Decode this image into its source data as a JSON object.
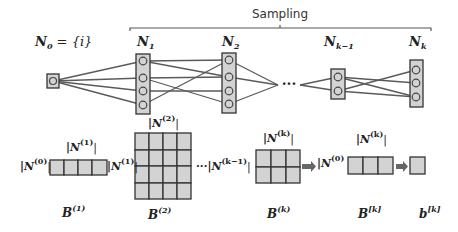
{
  "diagram": {
    "title": "Sampling",
    "colors": {
      "box_fill": "#d3d3d3",
      "box_stroke": "#333333",
      "edge": "#5a5a5a",
      "arrow": "#666666",
      "background": "#ffffff"
    },
    "layers": [
      {
        "id": "N0",
        "label_main": "N",
        "label_sub": "0",
        "label_rest": " = {i}",
        "nodes": 1
      },
      {
        "id": "N1",
        "label_main": "N",
        "label_sub": "1",
        "nodes": 4
      },
      {
        "id": "N2",
        "label_main": "N",
        "label_sub": "2",
        "nodes": 4
      },
      {
        "id": "Nk-1",
        "label_main": "N",
        "label_sub": "k−1",
        "nodes": 2
      },
      {
        "id": "Nk",
        "label_main": "N",
        "label_sub": "k",
        "nodes": 3
      }
    ],
    "ellipsis": "···",
    "matrices": [
      {
        "id": "B1",
        "rows": 1,
        "cols": 4,
        "row_label_main": "|N",
        "row_label_sup": "(0)",
        "col_label_main": "|N",
        "col_label_sup": "(1)",
        "name_main": "B",
        "name_sup": "(1)"
      },
      {
        "id": "B2",
        "rows": 4,
        "cols": 4,
        "row_label_main": "|N",
        "row_label_sup": "(1)",
        "col_label_main": "|N",
        "col_label_sup": "(2)",
        "name_main": "B",
        "name_sup": "(2)"
      },
      {
        "id": "Bk",
        "rows": 2,
        "cols": 3,
        "row_label_main": "···|N",
        "row_label_sup": "(k−1)",
        "col_label_main": "|N",
        "col_label_sup": "(k)",
        "name_main": "B",
        "name_sup": "(k)"
      },
      {
        "id": "Bbk",
        "rows": 1,
        "cols": 3,
        "row_label_main": "|N",
        "row_label_sup": "(0)",
        "col_label_main": "|N",
        "col_label_sup": "(k)",
        "name_main": "B",
        "name_sup": "[k]"
      },
      {
        "id": "bk",
        "rows": 1,
        "cols": 1,
        "name_main": "b",
        "name_sup": "[k]"
      }
    ],
    "pipe": "|"
  }
}
